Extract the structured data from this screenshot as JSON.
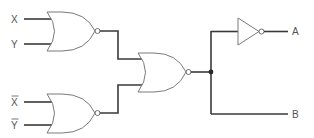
{
  "diagram": {
    "type": "logic-circuit",
    "inputs": [
      {
        "id": "in1",
        "label": "X",
        "negated": false
      },
      {
        "id": "in2",
        "label": "Y",
        "negated": false
      },
      {
        "id": "in3",
        "label": "X",
        "negated": true,
        "display": "X̄"
      },
      {
        "id": "in4",
        "label": "Y",
        "negated": true,
        "display": "Ȳ"
      }
    ],
    "gates": [
      {
        "id": "g1",
        "type": "NOR",
        "inputs": [
          "X",
          "Y"
        ]
      },
      {
        "id": "g2",
        "type": "NOR",
        "inputs": [
          "X̄",
          "Ȳ"
        ]
      },
      {
        "id": "g3",
        "type": "NOR",
        "inputs": [
          "g1",
          "g2"
        ]
      },
      {
        "id": "g4",
        "type": "NOT",
        "inputs": [
          "g3"
        ]
      }
    ],
    "outputs": [
      {
        "id": "outA",
        "label": "A",
        "source": "g4"
      },
      {
        "id": "outB",
        "label": "B",
        "source": "g3"
      }
    ],
    "colors": {
      "wire": "#3a3a3a",
      "gate_outline": "#7a7a7a",
      "label": "#555555"
    }
  }
}
